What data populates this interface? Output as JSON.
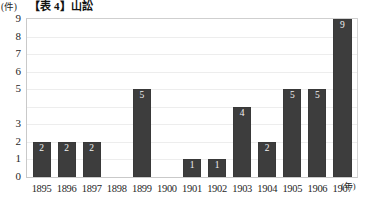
{
  "header": {
    "title": "【表 4】山訟",
    "y_unit": "(件)",
    "x_unit": "(年)"
  },
  "chart_data": {
    "type": "bar",
    "title": "【表 4】山訟",
    "xlabel": "(年)",
    "ylabel": "(件)",
    "categories": [
      "1895",
      "1896",
      "1897",
      "1898",
      "1899",
      "1900",
      "1901",
      "1902",
      "1903",
      "1904",
      "1905",
      "1906",
      "1907"
    ],
    "values": [
      2,
      2,
      2,
      0,
      5,
      0,
      1,
      1,
      4,
      2,
      5,
      5,
      9
    ],
    "value_labels": [
      "2",
      "2",
      "2",
      "",
      "5",
      "",
      "1",
      "1",
      "4",
      "2",
      "5",
      "5",
      "9"
    ],
    "ylim": [
      0,
      9
    ],
    "ytick_values": [
      9,
      8,
      7,
      6,
      5,
      4,
      3,
      2,
      1,
      0
    ],
    "ytick_labels": [
      "9",
      "8",
      "7",
      "6",
      "5",
      "",
      "3",
      "2",
      "1",
      "0"
    ],
    "grid": true,
    "legend": "none",
    "bar_color": "#3d3d3d",
    "value_label_color": "#f2f2f2",
    "gridline_color": "#ededed",
    "frame_color": "#c9c9c9"
  }
}
